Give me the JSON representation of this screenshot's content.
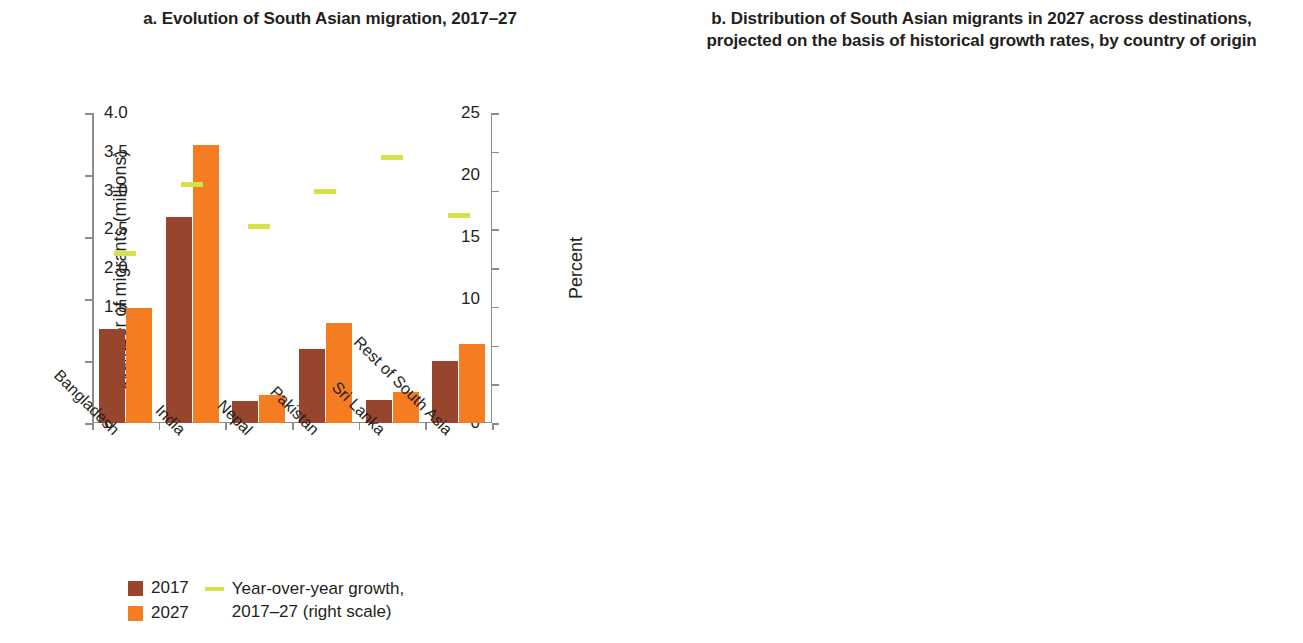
{
  "panel_a": {
    "title": "a. Evolution of South Asian migration, 2017–27",
    "y_axis_left_label": "Number of migrants (millions)",
    "y_axis_right_label": "Percent",
    "y_left_ticks": [
      "25",
      "20",
      "15",
      "10",
      "5",
      "0"
    ],
    "y_right_ticks": [
      "4.0",
      "3.5",
      "3.0",
      "2.5",
      "2.0",
      "1.5",
      "1.0",
      "0.5",
      "0"
    ],
    "categories": [
      "Bangladesh",
      "India",
      "Nepal",
      "Pakistan",
      "Sri Lanka",
      "Rest of South Asia"
    ],
    "legend": {
      "series_2017": "2017",
      "series_2027": "2027",
      "growth_line": "Year-over-year growth,",
      "growth_line_2": "2017–27 (right scale)"
    },
    "colors": {
      "c2017": "#97452d",
      "c2027": "#f57c20",
      "growth": "#d6e14a"
    }
  },
  "panel_b": {
    "title": "b. Distribution of South Asian migrants in 2027 across destinations, projected on the basis of historical growth rates, by country of origin",
    "y_axis_label": "Percent",
    "y_ticks": [
      "100",
      "80",
      "60",
      "40",
      "20",
      "0"
    ],
    "categories": [
      "Bangladesh",
      "India",
      "Nepal",
      "Pakistan",
      "Sri Lanka",
      "Rest of South Asia"
    ],
    "legend": [
      {
        "label": "IND",
        "color": "#b9533c"
      },
      {
        "label": "PAK",
        "color": "#f57c20"
      },
      {
        "label": "QAT",
        "color": "#e0e34a"
      },
      {
        "label": "SAU",
        "color": "#86bdec"
      },
      {
        "label": "UAE",
        "color": "#2f6fd0"
      },
      {
        "label": "xGCC",
        "color": "#82c96a"
      },
      {
        "label": "xMENA",
        "color": "#dfe2ce"
      },
      {
        "label": "MYS",
        "color": "#100c08"
      },
      {
        "label": "OECD",
        "color": "#b2622c"
      },
      {
        "label": "xEASIA",
        "color": "#b8821f"
      },
      {
        "label": "SSA",
        "color": "#2d6b46"
      }
    ]
  },
  "chart_data": [
    {
      "type": "bar",
      "panel": "a",
      "title": "a. Evolution of South Asian migration, 2017–27",
      "xlabel": "",
      "ylabel": "Number of migrants (millions)",
      "ylabel_right": "Percent",
      "ylim": [
        0,
        25
      ],
      "ylim_right": [
        0,
        4.0
      ],
      "grid": false,
      "legend_position": "bottom-left",
      "categories": [
        "Bangladesh",
        "India",
        "Nepal",
        "Pakistan",
        "Sri Lanka",
        "Rest of South Asia"
      ],
      "series": [
        {
          "name": "2017",
          "color": "#97452d",
          "values": [
            7.6,
            16.6,
            1.8,
            6.0,
            1.85,
            5.0
          ]
        },
        {
          "name": "2027",
          "color": "#f57c20",
          "values": [
            9.3,
            22.4,
            2.25,
            8.1,
            2.5,
            6.4
          ]
        },
        {
          "name": "Year-over-year growth, 2017–27 (right scale)",
          "color": "#d6e14a",
          "axis": "right",
          "unit": "percent",
          "values": [
            2.15,
            3.05,
            2.5,
            2.95,
            3.4,
            2.65
          ]
        }
      ]
    },
    {
      "type": "bar",
      "subtype": "stacked-100",
      "panel": "b",
      "title": "b. Distribution of South Asian migrants in 2027 across destinations, projected on the basis of historical growth rates, by country of origin",
      "xlabel": "",
      "ylabel": "Percent",
      "ylim": [
        0,
        100
      ],
      "grid": false,
      "legend_position": "bottom",
      "categories": [
        "Bangladesh",
        "India",
        "Nepal",
        "Pakistan",
        "Sri Lanka",
        "Rest of South Asia"
      ],
      "series": [
        {
          "name": "IND",
          "color": "#b9533c",
          "values": [
            32.0,
            0.0,
            23.0,
            13.0,
            5.5,
            0.0
          ]
        },
        {
          "name": "PAK",
          "color": "#f57c20",
          "values": [
            0.0,
            6.5,
            0.0,
            0.0,
            0.0,
            20.0
          ]
        },
        {
          "name": "QAT",
          "color": "#e0e34a",
          "values": [
            1.5,
            4.0,
            8.0,
            1.5,
            4.0,
            0.0
          ]
        },
        {
          "name": "SAU",
          "color": "#86bdec",
          "values": [
            24.0,
            19.5,
            39.5,
            31.5,
            37.5,
            17.0
          ]
        },
        {
          "name": "UAE",
          "color": "#2f6fd0",
          "values": [
            14.0,
            19.0,
            0.0,
            15.0,
            6.0,
            0.0
          ]
        },
        {
          "name": "xGCC",
          "color": "#82c96a",
          "values": [
            10.0,
            20.5,
            2.0,
            12.5,
            5.0,
            0.0
          ]
        },
        {
          "name": "xMENA",
          "color": "#dfe2ce",
          "values": [
            0.0,
            0.0,
            0.0,
            0.0,
            0.0,
            46.0
          ]
        },
        {
          "name": "MYS",
          "color": "#100c08",
          "values": [
            7.0,
            1.0,
            12.5,
            0.8,
            0.0,
            0.0
          ]
        },
        {
          "name": "OECD",
          "color": "#b2622c",
          "values": [
            10.5,
            28.0,
            14.0,
            25.0,
            41.0,
            17.0
          ]
        },
        {
          "name": "xEASIA",
          "color": "#b8821f",
          "values": [
            1.0,
            1.0,
            1.0,
            0.5,
            0.7,
            0.0
          ]
        },
        {
          "name": "SSA",
          "color": "#2d6b46",
          "values": [
            0.0,
            0.5,
            0.0,
            0.2,
            0.3,
            0.0
          ]
        }
      ]
    }
  ]
}
